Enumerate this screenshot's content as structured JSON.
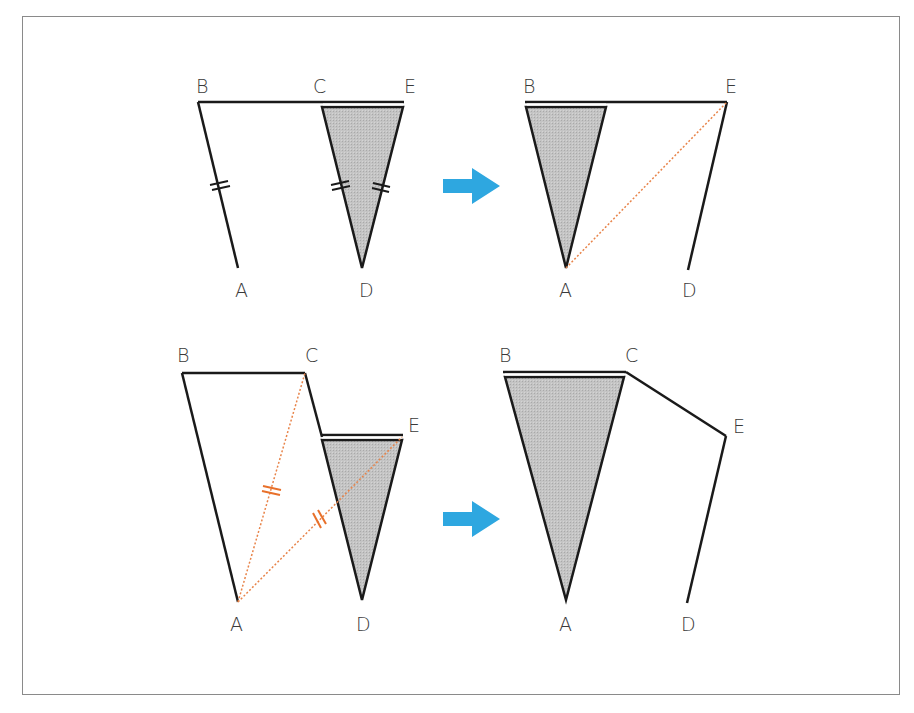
{
  "colors": {
    "line": "#1a1a1a",
    "shade": "#bdbdbd",
    "dotted": "#e8844a",
    "tick_orange": "#e8702a",
    "arrow": "#2ea7e0",
    "frame": "#8a8a8a"
  },
  "panels": [
    {
      "id": "top-left",
      "labels": {
        "B": "B",
        "C": "C",
        "E": "E",
        "A": "A",
        "D": "D"
      }
    },
    {
      "id": "top-right",
      "labels": {
        "B": "B",
        "E": "E",
        "A": "A",
        "D": "D"
      }
    },
    {
      "id": "bottom-left",
      "labels": {
        "B": "B",
        "C": "C",
        "E": "E",
        "A": "A",
        "D": "D"
      }
    },
    {
      "id": "bottom-right",
      "labels": {
        "B": "B",
        "C": "C",
        "E": "E",
        "A": "A",
        "D": "D"
      }
    }
  ],
  "arrows": [
    {
      "id": "arrow-top",
      "icon": "right-arrow-icon"
    },
    {
      "id": "arrow-bottom",
      "icon": "right-arrow-icon"
    }
  ]
}
